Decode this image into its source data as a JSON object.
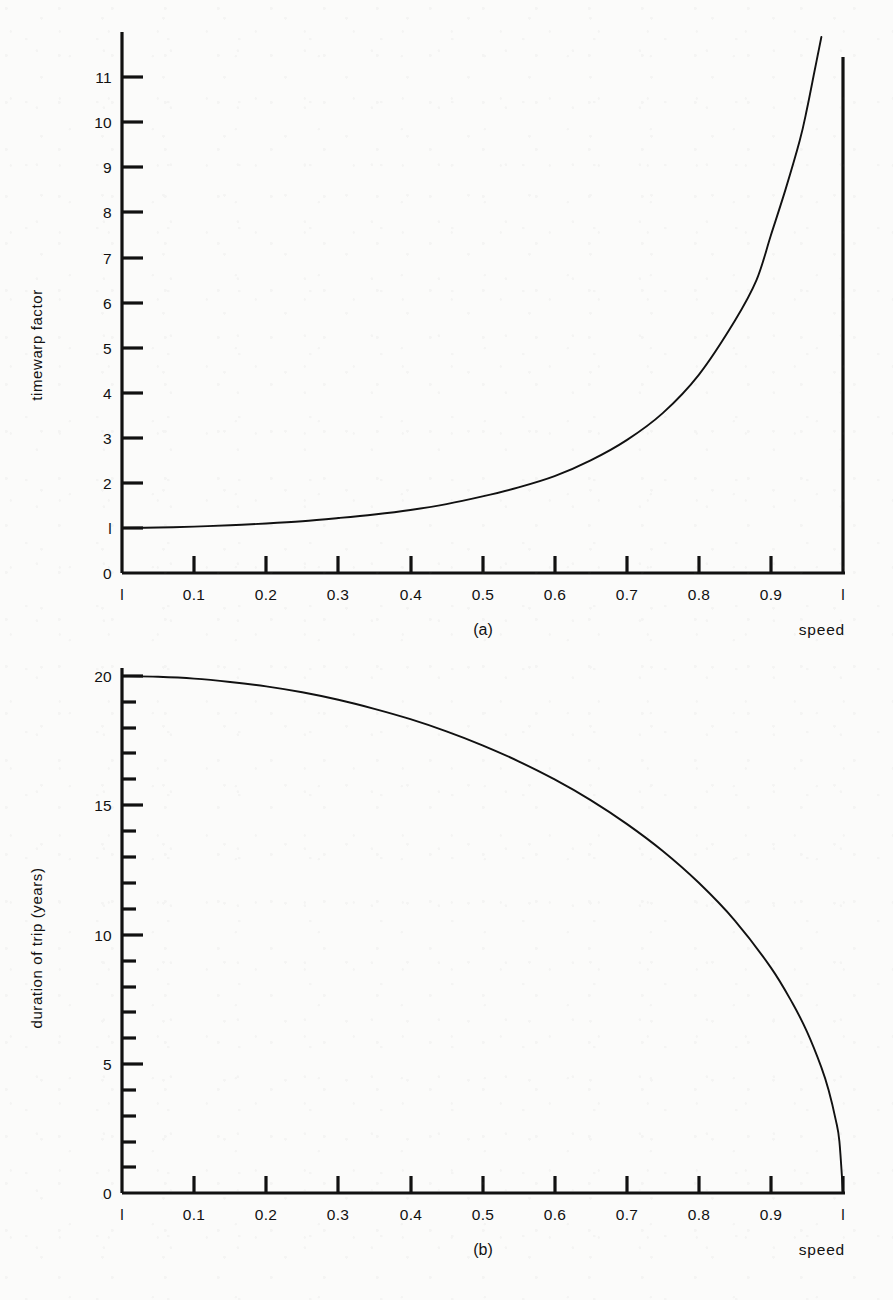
{
  "page": {
    "background_color": "#fbfbfa",
    "ink_color": "#111111"
  },
  "panels": [
    {
      "id": "a",
      "caption": "(a)",
      "x_axis_name": "speed",
      "y_axis_name": "timewarp factor"
    },
    {
      "id": "b",
      "caption": "(b)",
      "x_axis_name": "speed",
      "y_axis_name": "duration of trip (years)"
    }
  ],
  "chart_data": [
    {
      "type": "line",
      "panel": "a",
      "title": "",
      "caption": "(a)",
      "xlabel": "speed",
      "ylabel": "timewarp factor",
      "xlim": [
        0,
        1
      ],
      "ylim": [
        0,
        11.9
      ],
      "grid": false,
      "legend": null,
      "x_ticks": [
        0,
        0.1,
        0.2,
        0.3,
        0.4,
        0.5,
        0.6,
        0.7,
        0.8,
        0.9,
        1
      ],
      "x_tick_labels": [
        "l",
        "0.1",
        "0.2",
        "0.3",
        "0.4",
        "0.5",
        "0.6",
        "0.7",
        "0.8",
        "0.9",
        "l"
      ],
      "y_ticks": [
        0,
        1,
        2,
        3,
        4,
        5,
        6,
        7,
        8,
        9,
        10,
        11
      ],
      "y_tick_labels": [
        "0",
        "l",
        "2",
        "3",
        "4",
        "5",
        "6",
        "7",
        "8",
        "9",
        "10",
        "11"
      ],
      "y_minor_ticks": [],
      "asymptote_x": 1,
      "x": [
        0,
        0.05,
        0.1,
        0.15,
        0.2,
        0.25,
        0.3,
        0.35,
        0.4,
        0.45,
        0.5,
        0.55,
        0.6,
        0.65,
        0.7,
        0.75,
        0.8,
        0.85,
        0.88,
        0.9,
        0.92,
        0.94,
        0.95,
        0.96,
        0.965,
        0.97
      ],
      "y": [
        1,
        1.01,
        1.03,
        1.06,
        1.1,
        1.15,
        1.22,
        1.3,
        1.4,
        1.53,
        1.7,
        1.9,
        2.15,
        2.5,
        2.95,
        3.55,
        4.4,
        5.6,
        6.5,
        7.5,
        8.5,
        9.6,
        10.3,
        11.1,
        11.5,
        11.9
      ]
    },
    {
      "type": "line",
      "panel": "b",
      "title": "",
      "caption": "(b)",
      "xlabel": "speed",
      "ylabel": "duration of trip (years)",
      "xlim": [
        0,
        1
      ],
      "ylim": [
        0,
        20
      ],
      "grid": false,
      "legend": null,
      "x_ticks": [
        0,
        0.1,
        0.2,
        0.3,
        0.4,
        0.5,
        0.6,
        0.7,
        0.8,
        0.9,
        1
      ],
      "x_tick_labels": [
        "l",
        "0.1",
        "0.2",
        "0.3",
        "0.4",
        "0.5",
        "0.6",
        "0.7",
        "0.8",
        "0.9",
        "l"
      ],
      "y_ticks": [
        0,
        5,
        10,
        15,
        20
      ],
      "y_tick_labels": [
        "0",
        "5",
        "10",
        "15",
        "20"
      ],
      "y_minor_ticks": [
        1,
        2,
        3,
        4,
        6,
        7,
        8,
        9,
        11,
        12,
        13,
        14,
        16,
        17,
        18,
        19
      ],
      "x": [
        0,
        0.05,
        0.1,
        0.15,
        0.2,
        0.25,
        0.3,
        0.35,
        0.4,
        0.45,
        0.5,
        0.55,
        0.6,
        0.65,
        0.7,
        0.75,
        0.8,
        0.85,
        0.9,
        0.93,
        0.95,
        0.97,
        0.98,
        0.99,
        0.995,
        1
      ],
      "y": [
        20,
        19.97,
        19.9,
        19.77,
        19.6,
        19.37,
        19.08,
        18.73,
        18.33,
        17.86,
        17.32,
        16.7,
        16.0,
        15.2,
        14.28,
        13.23,
        12.0,
        10.54,
        8.72,
        7.34,
        6.24,
        4.86,
        3.98,
        2.82,
        2.0,
        0
      ]
    }
  ]
}
